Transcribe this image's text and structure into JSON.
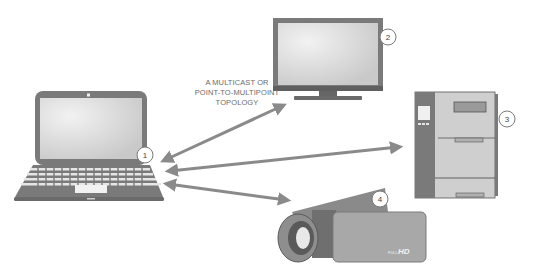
{
  "caption": {
    "line1": "A MULTICAST OR",
    "line2": "POINT-TO-MULTIPOINT",
    "line3": "TOPOLOGY"
  },
  "devices": [
    {
      "id": 1,
      "name": "laptop",
      "label": "1"
    },
    {
      "id": 2,
      "name": "monitor",
      "label": "2"
    },
    {
      "id": 3,
      "name": "printer",
      "label": "3"
    },
    {
      "id": 4,
      "name": "camcorder",
      "label": "4"
    }
  ],
  "camcorder_brand": {
    "small": "FULL",
    "large": "HD"
  },
  "connections": [
    {
      "from": 1,
      "to": 2,
      "type": "bidirectional"
    },
    {
      "from": 1,
      "to": 3,
      "type": "bidirectional"
    },
    {
      "from": 1,
      "to": 4,
      "type": "bidirectional"
    }
  ],
  "colors": {
    "arrow": "#8a8a8a",
    "device_dark": "#7a7a7a",
    "device_mid": "#a8a8a8",
    "device_light": "#cfcfcf",
    "screen": "#d9d9d9",
    "badge_fill": "#ffffff",
    "badge_stroke": "#7a7a7a",
    "text": "#6b6b6b"
  }
}
